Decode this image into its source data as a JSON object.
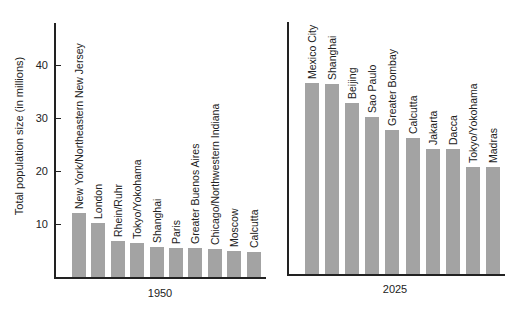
{
  "chart_data": [
    {
      "type": "bar",
      "title": "1950",
      "xlabel": "1950",
      "ylabel": "Total population size (in millions)",
      "ylim": [
        0,
        47
      ],
      "yticks": [
        10,
        20,
        30,
        40
      ],
      "grid": false,
      "categories": [
        "New York/Northeastern New Jersey",
        "London",
        "Rhein/Ruhr",
        "Tokyo/Yokohama",
        "Shanghai",
        "Paris",
        "Greater Buenos Aires",
        "Chicago/Northwestern Indiana",
        "Moscow",
        "Calcutta"
      ],
      "values": [
        12.1,
        10.2,
        6.8,
        6.4,
        5.6,
        5.5,
        5.5,
        5.2,
        4.9,
        4.8
      ]
    },
    {
      "type": "bar",
      "title": "2025",
      "xlabel": "2025",
      "ylabel": "Total population size (in millions)",
      "ylim": [
        0,
        47
      ],
      "grid": false,
      "categories": [
        "Mexico City",
        "Shanghai",
        "Beijing",
        "Sao Paulo",
        "Greater Bombay",
        "Calcutta",
        "Jakarta",
        "Dacca",
        "Tokyo/Yokohama",
        "Madras"
      ],
      "values": [
        36.0,
        35.8,
        32.3,
        29.6,
        27.2,
        25.7,
        23.6,
        23.6,
        20.2,
        20.2
      ]
    }
  ],
  "labels": {
    "ylabel": "Total population size (in millions)",
    "left_year": "1950",
    "right_year": "2025",
    "ticks": [
      "10",
      "20",
      "30",
      "40"
    ]
  }
}
